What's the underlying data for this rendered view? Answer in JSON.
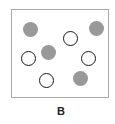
{
  "diagram": {
    "label": "B",
    "frame": {
      "border_color": "#a9a9a9"
    },
    "colors": {
      "filled": "#999999",
      "open_stroke": "#1a1a1a"
    },
    "circles": [
      {
        "type": "filled",
        "cx": 30,
        "cy": 29
      },
      {
        "type": "filled",
        "cx": 96,
        "cy": 28
      },
      {
        "type": "open",
        "cx": 70,
        "cy": 38
      },
      {
        "type": "filled",
        "cx": 48,
        "cy": 52
      },
      {
        "type": "open",
        "cx": 28,
        "cy": 58
      },
      {
        "type": "open",
        "cx": 88,
        "cy": 58
      },
      {
        "type": "open",
        "cx": 46,
        "cy": 80
      },
      {
        "type": "filled",
        "cx": 80,
        "cy": 78
      }
    ],
    "counts": {
      "filled": 4,
      "open": 4
    }
  }
}
